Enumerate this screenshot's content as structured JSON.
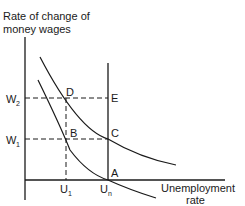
{
  "diagram": {
    "y_axis_label_line1": "Rate of change of",
    "y_axis_label_line2": "money wages",
    "x_axis_label_line1": "Unemployment",
    "x_axis_label_line2": "rate",
    "y_ticks": [
      {
        "letter": "W",
        "sub": "2"
      },
      {
        "letter": "W",
        "sub": "1"
      }
    ],
    "x_ticks": [
      {
        "letter": "U",
        "sub": "1"
      },
      {
        "letter": "U",
        "sub": "n"
      }
    ],
    "points": {
      "A": "A",
      "B": "B",
      "C": "C",
      "D": "D",
      "E": "E"
    },
    "curves": [
      "short-run Phillips curve (lower)",
      "short-run Phillips curve (upper)"
    ],
    "vertical_line": "long-run Phillips curve at natural rate"
  }
}
